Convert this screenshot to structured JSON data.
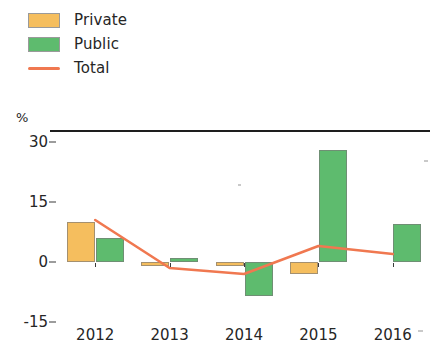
{
  "legend": {
    "items": [
      {
        "label": "Private",
        "color": "#F5BE5E",
        "marker": "square-swatch"
      },
      {
        "label": "Public",
        "color": "#5EBB6E",
        "marker": "square-swatch"
      },
      {
        "label": "Total",
        "color": "#F07850",
        "marker": "line-swatch"
      }
    ]
  },
  "axis": {
    "unit_label": "%",
    "y_ticks": [
      "30",
      "15",
      "0",
      "-15"
    ]
  },
  "chart_data": {
    "type": "bar",
    "title": "",
    "subtitle": "",
    "xlabel": "",
    "ylabel": "%",
    "categories": [
      "2012",
      "2013",
      "2014",
      "2015",
      "2016"
    ],
    "ylim": [
      -15,
      33
    ],
    "ytick_values": [
      30,
      15,
      0,
      -15
    ],
    "grid": false,
    "legend_position": "top-left",
    "zero_line": true,
    "series": [
      {
        "name": "Private",
        "type": "bar",
        "color": "#F5BE5E",
        "values": [
          10,
          -1,
          -1,
          -3,
          0
        ]
      },
      {
        "name": "Public",
        "type": "bar",
        "color": "#5EBB6E",
        "values": [
          6,
          1,
          -8.5,
          28,
          9.5
        ]
      },
      {
        "name": "Total",
        "type": "line",
        "color": "#F07850",
        "values": [
          10.5,
          -1.5,
          -3,
          4,
          2
        ]
      }
    ]
  }
}
